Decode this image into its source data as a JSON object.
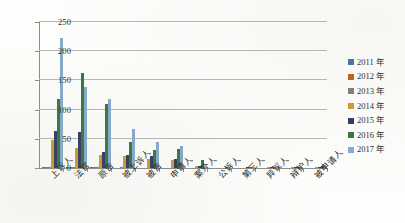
{
  "chart_data": {
    "type": "bar",
    "title": "",
    "subtitle": "",
    "xlabel": "",
    "ylabel": "",
    "ylim": [
      0,
      250
    ],
    "yticks": [
      0,
      50,
      100,
      150,
      200,
      250
    ],
    "grid": true,
    "legend_position": "right",
    "categories": [
      "上诉人",
      "法官",
      "原告",
      "被上诉人",
      "被告",
      "申请人",
      "案外人",
      "公诉人",
      "第三人",
      "异议人",
      "辩护人",
      "被申请人"
    ],
    "series": [
      {
        "name": "2011 年",
        "color": "#4a6f9c",
        "values": [
          2,
          1,
          1,
          0,
          0,
          0,
          0,
          0,
          0,
          0,
          0,
          0
        ]
      },
      {
        "name": "2012 年",
        "color": "#b8651b",
        "values": [
          1,
          1,
          1,
          0,
          0,
          0,
          0,
          0,
          0,
          0,
          0,
          0
        ]
      },
      {
        "name": "2013 年",
        "color": "#7d7d78",
        "values": [
          2,
          1,
          1,
          1,
          0,
          0,
          0,
          0,
          0,
          0,
          0,
          0
        ]
      },
      {
        "name": "2014 年",
        "color": "#d49a2a",
        "values": [
          48,
          35,
          23,
          21,
          15,
          13,
          3,
          0,
          0,
          1,
          1,
          2
        ]
      },
      {
        "name": "2015 年",
        "color": "#2d3b66",
        "values": [
          63,
          61,
          28,
          22,
          20,
          16,
          4,
          0,
          1,
          1,
          2,
          2
        ]
      },
      {
        "name": "2016 年",
        "color": "#3c7340",
        "values": [
          118,
          163,
          110,
          44,
          30,
          33,
          13,
          1,
          1,
          1,
          2,
          3
        ]
      },
      {
        "name": "2017 年",
        "color": "#85aacd",
        "values": [
          223,
          139,
          118,
          66,
          45,
          37,
          1,
          1,
          2,
          1,
          2,
          3
        ]
      }
    ]
  },
  "legend": {
    "items": [
      {
        "label": "2011 年"
      },
      {
        "label": "2012 年"
      },
      {
        "label": "2013 年"
      },
      {
        "label": "2014 年"
      },
      {
        "label": "2015 年"
      },
      {
        "label": "2016 年"
      },
      {
        "label": "2017 年"
      }
    ]
  },
  "caption": {
    "text": ""
  }
}
